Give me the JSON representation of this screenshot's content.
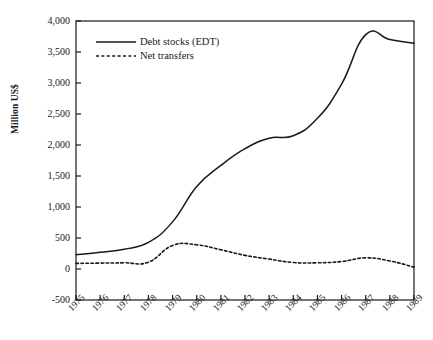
{
  "chart_data": {
    "type": "line",
    "title": "",
    "xlabel": "",
    "ylabel": "Million US$",
    "x": [
      1975,
      1976,
      1977,
      1978,
      1979,
      1980,
      1981,
      1982,
      1983,
      1984,
      1985,
      1986,
      1987,
      1988,
      1989
    ],
    "xtick_labels": [
      "1975",
      "1976",
      "1977",
      "1978",
      "1979",
      "1980",
      "1981",
      "1982",
      "1983",
      "1984",
      "1985",
      "1986",
      "1987",
      "1988",
      "1989"
    ],
    "ytick_labels": [
      "-500",
      "0",
      "500",
      "1,000",
      "1,500",
      "2,000",
      "2,500",
      "3,000",
      "3,500",
      "4,000"
    ],
    "ytick_values": [
      -500,
      0,
      500,
      1000,
      1500,
      2000,
      2500,
      3000,
      3500,
      4000
    ],
    "ylim": [
      -500,
      4000
    ],
    "xlim": [
      1975,
      1989
    ],
    "grid": false,
    "legend_position": "top-left",
    "series": [
      {
        "name": "Debt stocks (EDT)",
        "style": "solid",
        "color": "#1a1a1a",
        "values": [
          230,
          270,
          320,
          430,
          760,
          1330,
          1670,
          1940,
          2110,
          2150,
          2430,
          2980,
          3780,
          3700,
          3640
        ]
      },
      {
        "name": "Net transfers",
        "style": "dashed",
        "color": "#1a1a1a",
        "values": [
          90,
          95,
          100,
          110,
          380,
          390,
          310,
          220,
          160,
          105,
          100,
          120,
          180,
          130,
          30
        ]
      }
    ]
  },
  "legend": {
    "items": [
      {
        "label": "Debt stocks (EDT)",
        "style": "solid"
      },
      {
        "label": "Net transfers",
        "style": "dashed"
      }
    ]
  },
  "axis": {
    "y_title": "Million US$"
  },
  "colors": {
    "line": "#1a1a1a",
    "frame": "#1a1a1a",
    "background": "#ffffff"
  }
}
